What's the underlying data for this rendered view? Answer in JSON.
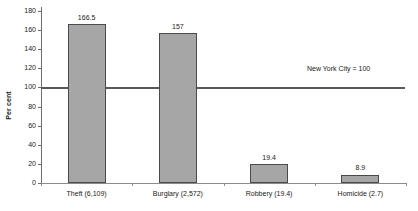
{
  "chart_data": {
    "type": "bar",
    "title": "",
    "xlabel": "",
    "ylabel": "Per cent",
    "ylim": [
      0,
      180
    ],
    "ytick_step": 20,
    "grid": false,
    "legend": "none",
    "categories": [
      "Theft (6,109)",
      "Burglary (2,572)",
      "Robbery (19.4)",
      "Homicide (2.7)"
    ],
    "values": [
      166.5,
      157,
      19.4,
      8.9
    ],
    "value_labels": [
      "166.5",
      "157",
      "19.4",
      "8.9"
    ],
    "ytick_labels": [
      "0",
      "20",
      "40",
      "60",
      "80",
      "100",
      "120",
      "140",
      "160",
      "180"
    ],
    "annotations": [
      {
        "text": "New York City = 100",
        "value": 100,
        "kind": "reference-line-label"
      }
    ],
    "reference_line": {
      "value": 100,
      "label": "New York City = 100"
    },
    "colors": {
      "bar_fill": "#a6a6a6",
      "bar_border": "#4a4a4a",
      "axis": "#6e6e6e",
      "reference_line": "#585858",
      "text": "#1a1a1a",
      "background": "#ffffff"
    }
  }
}
